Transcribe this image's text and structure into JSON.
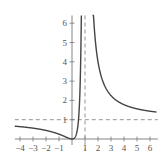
{
  "chart_data": {
    "type": "line",
    "title": "",
    "xlabel": "",
    "ylabel": "",
    "function": "y = x^2/(x-1)^2",
    "xlim": [
      -4.4,
      6.6
    ],
    "ylim": [
      -0.3,
      6.4
    ],
    "x_ticks": [
      -4,
      -3,
      -2,
      -1,
      1,
      2,
      3,
      4,
      5,
      6
    ],
    "x_tick_labels": [
      "−4",
      "−3",
      "−2",
      "−1",
      "1",
      "2",
      "3",
      "4",
      "5",
      "6"
    ],
    "y_ticks": [
      1,
      2,
      3,
      4,
      5,
      6
    ],
    "y_tick_labels": [
      "1",
      "2",
      "3",
      "4",
      "5",
      "6"
    ],
    "asymptotes": [
      {
        "type": "vertical",
        "x": 1,
        "style": "dashed"
      },
      {
        "type": "horizontal",
        "y": 1,
        "style": "dashed"
      }
    ],
    "series": [
      {
        "name": "left-branch",
        "x": [
          -4.4,
          -4,
          -3,
          -2,
          -1,
          -0.5,
          0,
          0.3,
          0.5,
          0.6,
          0.7,
          0.72
        ],
        "y": [
          0.66,
          0.64,
          0.5625,
          0.444,
          0.25,
          0.111,
          0,
          0.184,
          1,
          2.25,
          5.44,
          6.6
        ]
      },
      {
        "name": "right-branch",
        "x": [
          1.58,
          1.7,
          2,
          2.5,
          3,
          4,
          5,
          6,
          6.5
        ],
        "y": [
          7.4,
          5.9,
          4,
          2.78,
          2.25,
          1.78,
          1.5625,
          1.44,
          1.4
        ]
      }
    ],
    "grid": false,
    "legend": null,
    "colors": {
      "curve": "#444444",
      "axis": "#777777",
      "asymptote": "#888888"
    }
  }
}
